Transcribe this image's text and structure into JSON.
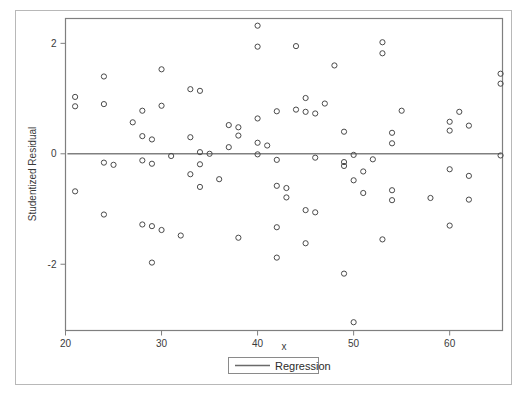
{
  "chart_data": {
    "type": "scatter",
    "title": "",
    "xlabel": "x",
    "ylabel": "Studentized Residual",
    "xlim": [
      20,
      65.5
    ],
    "ylim": [
      -3.2,
      2.45
    ],
    "xticks": [
      20,
      30,
      40,
      50,
      60
    ],
    "xtick_labels": [
      "20",
      "30",
      "40",
      "50",
      "60"
    ],
    "yticks": [
      2,
      0,
      -2
    ],
    "ytick_labels": [
      "2",
      "0",
      "-2"
    ],
    "grid": false,
    "legend_position": "below-axis-center",
    "legend": [
      {
        "label": "Regression",
        "marker": "line",
        "color": "#6a6a6a"
      }
    ],
    "series": [
      {
        "name": "Studentized Residual",
        "marker": "open-circle",
        "color": "#4a4a4a",
        "points": [
          [
            21.0,
            1.03
          ],
          [
            21.0,
            0.86
          ],
          [
            21.0,
            -0.68
          ],
          [
            24.0,
            1.4
          ],
          [
            24.0,
            0.9
          ],
          [
            24.0,
            -0.16
          ],
          [
            24.0,
            -1.1
          ],
          [
            25.0,
            -0.2
          ],
          [
            27.0,
            0.57
          ],
          [
            28.0,
            0.78
          ],
          [
            28.0,
            0.32
          ],
          [
            28.0,
            -0.12
          ],
          [
            28.0,
            -1.28
          ],
          [
            29.0,
            0.26
          ],
          [
            29.0,
            -0.18
          ],
          [
            29.0,
            -1.31
          ],
          [
            29.0,
            -1.97
          ],
          [
            30.0,
            1.53
          ],
          [
            30.0,
            0.87
          ],
          [
            30.0,
            -1.38
          ],
          [
            31.0,
            -0.04
          ],
          [
            32.0,
            -1.48
          ],
          [
            33.0,
            1.17
          ],
          [
            33.0,
            0.3
          ],
          [
            33.0,
            -0.37
          ],
          [
            34.0,
            1.14
          ],
          [
            34.0,
            0.03
          ],
          [
            34.0,
            -0.19
          ],
          [
            34.0,
            -0.6
          ],
          [
            35.0,
            0.0
          ],
          [
            36.0,
            -0.46
          ],
          [
            37.0,
            0.52
          ],
          [
            37.0,
            0.12
          ],
          [
            38.0,
            0.48
          ],
          [
            38.0,
            0.33
          ],
          [
            38.0,
            -1.52
          ],
          [
            40.0,
            2.32
          ],
          [
            40.0,
            1.94
          ],
          [
            40.0,
            0.64
          ],
          [
            40.0,
            0.2
          ],
          [
            40.0,
            -0.01
          ],
          [
            41.0,
            0.15
          ],
          [
            42.0,
            0.77
          ],
          [
            42.0,
            -0.11
          ],
          [
            42.0,
            -0.58
          ],
          [
            42.0,
            -1.33
          ],
          [
            42.0,
            -1.88
          ],
          [
            43.0,
            -0.62
          ],
          [
            43.0,
            -0.79
          ],
          [
            44.0,
            1.95
          ],
          [
            44.0,
            0.8
          ],
          [
            45.0,
            1.01
          ],
          [
            45.0,
            0.76
          ],
          [
            45.0,
            -1.02
          ],
          [
            45.0,
            -1.62
          ],
          [
            46.0,
            0.73
          ],
          [
            46.0,
            -0.07
          ],
          [
            46.0,
            -1.06
          ],
          [
            47.0,
            0.91
          ],
          [
            48.0,
            1.6
          ],
          [
            49.0,
            0.4
          ],
          [
            49.0,
            -0.15
          ],
          [
            49.0,
            -0.22
          ],
          [
            49.0,
            -2.17
          ],
          [
            50.0,
            -0.02
          ],
          [
            50.0,
            -0.48
          ],
          [
            50.0,
            -3.05
          ],
          [
            51.0,
            -0.32
          ],
          [
            51.0,
            -0.71
          ],
          [
            52.0,
            -0.1
          ],
          [
            53.0,
            2.02
          ],
          [
            53.0,
            1.82
          ],
          [
            53.0,
            -1.55
          ],
          [
            54.0,
            0.38
          ],
          [
            54.0,
            0.19
          ],
          [
            54.0,
            -0.66
          ],
          [
            54.0,
            -0.84
          ],
          [
            55.0,
            0.78
          ],
          [
            58.0,
            -0.8
          ],
          [
            60.0,
            0.58
          ],
          [
            60.0,
            0.42
          ],
          [
            60.0,
            -0.28
          ],
          [
            60.0,
            -1.3
          ],
          [
            61.0,
            0.76
          ],
          [
            62.0,
            0.51
          ],
          [
            62.0,
            -0.4
          ],
          [
            62.0,
            -0.83
          ],
          [
            65.3,
            1.45
          ],
          [
            65.3,
            1.27
          ],
          [
            65.3,
            -0.03
          ]
        ]
      }
    ],
    "regression": {
      "name": "Regression",
      "y_value": 0.0,
      "x_start": 20.2,
      "x_end": 65.4,
      "color": "#808080"
    }
  },
  "labels": {
    "y_axis_title": "Studentized Residual",
    "x_axis_title": "x",
    "legend_entry": "Regression"
  }
}
